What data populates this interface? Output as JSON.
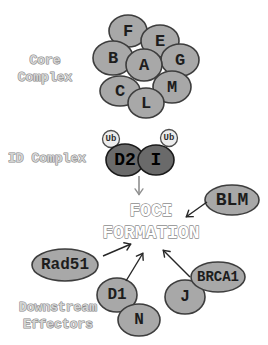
{
  "diagram": {
    "width": 268,
    "height": 345,
    "background": "#ffffff"
  },
  "colors": {
    "node_fill": "#a8a8a8",
    "node_stroke": "#3d3d3d",
    "node_text": "#1d1d1d",
    "id_node_fill": "#6a6a6a",
    "id_node_stroke": "#1a1a1a",
    "id_node_text": "#000000",
    "ub_fill": "#ededed",
    "ub_stroke": "#4d4d4d",
    "ub_text": "#2e2e2e",
    "section_label_fill": "#d4d4d4",
    "section_label_stroke": "#868686",
    "foci_fill": "#ffffff",
    "foci_stroke": "#8d8d8d",
    "arrow_gray": "#8f8f8f",
    "arrow_black": "#262626"
  },
  "section_labels": [
    {
      "name": "core-complex-label",
      "lines": [
        "Core",
        "Complex"
      ],
      "x": 45,
      "y": 60,
      "line_height": 17,
      "font_size": 13
    },
    {
      "name": "id-complex-label",
      "lines": [
        "ID Complex"
      ],
      "x": 47,
      "y": 158,
      "line_height": 17,
      "font_size": 13
    },
    {
      "name": "downstream-effectors-label",
      "lines": [
        "Downstream",
        "Effectors"
      ],
      "x": 58,
      "y": 307,
      "line_height": 17,
      "font_size": 13
    }
  ],
  "center_text": {
    "name": "foci-formation-label",
    "lines": [
      "FOCI",
      "FORMATION"
    ],
    "x": 151,
    "y": 211,
    "line_height": 22,
    "font_size": 18
  },
  "nodes": [
    {
      "name": "node-fancf",
      "label": "F",
      "cx": 128,
      "cy": 31,
      "rx": 19,
      "ry": 16,
      "style": "core",
      "font_size": 17
    },
    {
      "name": "node-fance",
      "label": "E",
      "cx": 160,
      "cy": 41,
      "rx": 19,
      "ry": 16,
      "style": "core",
      "font_size": 17
    },
    {
      "name": "node-fancb",
      "label": "B",
      "cx": 113,
      "cy": 58,
      "rx": 20,
      "ry": 17,
      "style": "core",
      "font_size": 17
    },
    {
      "name": "node-fancg",
      "label": "G",
      "cx": 180,
      "cy": 60,
      "rx": 19,
      "ry": 16,
      "style": "core",
      "font_size": 17
    },
    {
      "name": "node-fanca",
      "label": "A",
      "cx": 144,
      "cy": 65,
      "rx": 18,
      "ry": 16,
      "style": "core",
      "font_size": 17
    },
    {
      "name": "node-fancc",
      "label": "C",
      "cx": 120,
      "cy": 91,
      "rx": 20,
      "ry": 15,
      "style": "core",
      "font_size": 17
    },
    {
      "name": "node-fancm",
      "label": "M",
      "cx": 172,
      "cy": 87,
      "rx": 19,
      "ry": 16,
      "style": "core",
      "font_size": 17
    },
    {
      "name": "node-fancl",
      "label": "L",
      "cx": 146,
      "cy": 103,
      "rx": 18,
      "ry": 15,
      "style": "core",
      "font_size": 17
    },
    {
      "name": "node-ubiquitin-1",
      "label": "Ub",
      "cx": 111,
      "cy": 139,
      "rx": 8.5,
      "ry": 8.5,
      "style": "ub",
      "font_size": 9
    },
    {
      "name": "node-ubiquitin-2",
      "label": "Ub",
      "cx": 169,
      "cy": 138,
      "rx": 8.5,
      "ry": 8.5,
      "style": "ub",
      "font_size": 9
    },
    {
      "name": "node-fancd2",
      "label": "D2",
      "cx": 125,
      "cy": 160,
      "rx": 19,
      "ry": 16,
      "style": "id",
      "font_size": 18
    },
    {
      "name": "node-fanci",
      "label": "I",
      "cx": 156,
      "cy": 160,
      "rx": 18,
      "ry": 15,
      "style": "id",
      "font_size": 18
    },
    {
      "name": "node-blm",
      "label": "BLM",
      "cx": 232,
      "cy": 200,
      "rx": 27,
      "ry": 15,
      "style": "core",
      "font_size": 18
    },
    {
      "name": "node-rad51",
      "label": "Rad51",
      "cx": 65,
      "cy": 265,
      "rx": 33,
      "ry": 16,
      "style": "core",
      "font_size": 16
    },
    {
      "name": "node-fancd1",
      "label": "D1",
      "cx": 117,
      "cy": 295,
      "rx": 20,
      "ry": 17,
      "style": "core",
      "font_size": 16
    },
    {
      "name": "node-fancn",
      "label": "N",
      "cx": 139,
      "cy": 320,
      "rx": 21,
      "ry": 16,
      "style": "core",
      "font_size": 16
    },
    {
      "name": "node-fancj",
      "label": "J",
      "cx": 185,
      "cy": 297,
      "rx": 20,
      "ry": 17,
      "style": "core",
      "font_size": 16
    },
    {
      "name": "node-brca1",
      "label": "BRCA1",
      "cx": 218,
      "cy": 277,
      "rx": 27,
      "ry": 15,
      "style": "core",
      "font_size": 14
    }
  ],
  "arrows": [
    {
      "name": "arrow-id-complex-to-foci",
      "x1": 139,
      "y1": 176,
      "x2": 139,
      "y2": 195,
      "color": "gray",
      "width": 1.6
    },
    {
      "name": "arrow-blm-to-foci",
      "x1": 207,
      "y1": 202,
      "x2": 186,
      "y2": 217,
      "color": "black",
      "width": 1.4
    },
    {
      "name": "arrow-rad51-to-foci",
      "x1": 103,
      "y1": 256,
      "x2": 131,
      "y2": 244,
      "color": "black",
      "width": 1.4
    },
    {
      "name": "arrow-d1-to-foci",
      "x1": 126,
      "y1": 281,
      "x2": 143,
      "y2": 253,
      "color": "black",
      "width": 1.4
    },
    {
      "name": "arrow-j-to-foci",
      "x1": 190,
      "y1": 277,
      "x2": 163,
      "y2": 250,
      "color": "black",
      "width": 1.4
    }
  ]
}
